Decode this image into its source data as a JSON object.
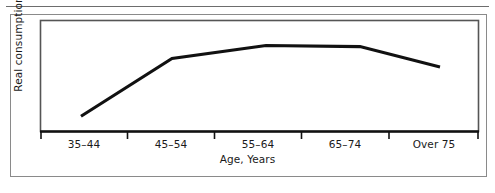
{
  "figure": {
    "y_axis_title": "Real consumption",
    "x_axis_title": "Age, Years",
    "caption_fragment": ""
  },
  "chart_data": {
    "type": "line",
    "title": "",
    "xlabel": "Age, Years",
    "ylabel": "Real consumption",
    "categories": [
      "35–44",
      "45–54",
      "55–64",
      "65–74",
      "Over 75"
    ],
    "tick_labels": [
      "35–44",
      "45–54",
      "55–64",
      "65–74",
      "Over 75"
    ],
    "values": [
      12,
      66,
      78,
      77,
      58
    ],
    "ylim": [
      0,
      100
    ],
    "yticks": [],
    "grid": false,
    "legend": null,
    "series": [
      {
        "name": "Real consumption",
        "values": [
          12,
          66,
          78,
          77,
          58
        ],
        "color": "#111111",
        "line_width": 3
      }
    ],
    "annotations": [],
    "axis_style": {
      "y_axis_ticks_shown": false,
      "x_axis_ticks_shown": true,
      "frame": "box"
    }
  },
  "colors": {
    "line": "#111111",
    "axis": "#111111",
    "frame": "#555555",
    "outer_border": "#8a8a8a",
    "background": "#ffffff"
  },
  "labels": {
    "x_ticks": [
      {
        "text": "35–44",
        "center_x": 84
      },
      {
        "text": "45–54",
        "center_x": 171
      },
      {
        "text": "55–64",
        "center_x": 258
      },
      {
        "text": "65–74",
        "center_x": 345
      },
      {
        "text": "Over 75",
        "center_x": 434
      }
    ]
  }
}
